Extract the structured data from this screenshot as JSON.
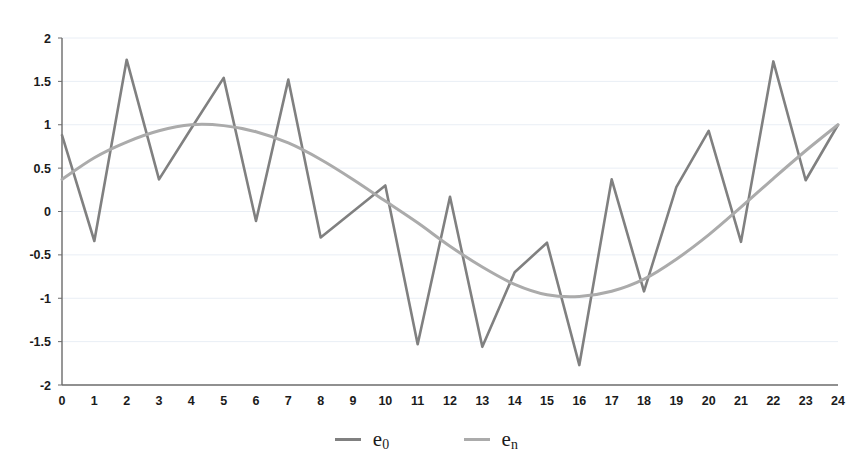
{
  "chart_data": {
    "type": "line",
    "title": "",
    "xlabel": "",
    "ylabel": "",
    "xlim": [
      0,
      24
    ],
    "ylim": [
      -2,
      2
    ],
    "grid": true,
    "grid_axis": "y",
    "legend_position": "bottom-center",
    "x": [
      0,
      1,
      2,
      3,
      4,
      5,
      6,
      7,
      8,
      9,
      10,
      11,
      12,
      13,
      14,
      15,
      16,
      17,
      18,
      19,
      20,
      21,
      22,
      23,
      24
    ],
    "xtick_labels": [
      "0",
      "1",
      "2",
      "3",
      "4",
      "5",
      "6",
      "7",
      "8",
      "9",
      "10",
      "11",
      "12",
      "13",
      "14",
      "15",
      "16",
      "17",
      "18",
      "19",
      "20",
      "21",
      "22",
      "23",
      "24"
    ],
    "ytick_labels": [
      "2",
      "1.5",
      "1",
      "0.5",
      "0",
      "-0.5",
      "-1",
      "-1.5",
      "-2"
    ],
    "ytick_values": [
      2,
      1.5,
      1,
      0.5,
      0,
      -0.5,
      -1,
      -1.5,
      -2
    ],
    "series": [
      {
        "name": "e_0",
        "label": "e",
        "subscript": "0",
        "color": "#808080",
        "width": 2.6,
        "values": [
          0.88,
          -0.34,
          1.75,
          0.37,
          0.96,
          1.54,
          -0.11,
          1.52,
          -0.3,
          0.0,
          0.3,
          -1.53,
          0.17,
          -1.56,
          -0.7,
          -0.36,
          -1.77,
          0.37,
          -0.92,
          0.28,
          0.93,
          -0.35,
          1.73,
          0.36,
          1.0
        ]
      },
      {
        "name": "e_n",
        "label": "e",
        "subscript": "n",
        "color": "#ababab",
        "width": 3.0,
        "values": [
          0.37,
          0.62,
          0.8,
          0.93,
          1.0,
          0.99,
          0.92,
          0.79,
          0.6,
          0.37,
          0.12,
          -0.13,
          -0.4,
          -0.64,
          -0.84,
          -0.96,
          -0.98,
          -0.92,
          -0.78,
          -0.55,
          -0.27,
          0.05,
          0.38,
          0.7,
          1.0
        ]
      }
    ]
  },
  "legend": {
    "entries": [
      {
        "label": "e",
        "subscript": "0",
        "color": "#808080"
      },
      {
        "label": "e",
        "subscript": "n",
        "color": "#ababab"
      }
    ]
  },
  "axes": {
    "frame_color": "#6b6b6b",
    "grid_color": "#e9eef5",
    "tick_text_color": "#1b1b1b"
  }
}
